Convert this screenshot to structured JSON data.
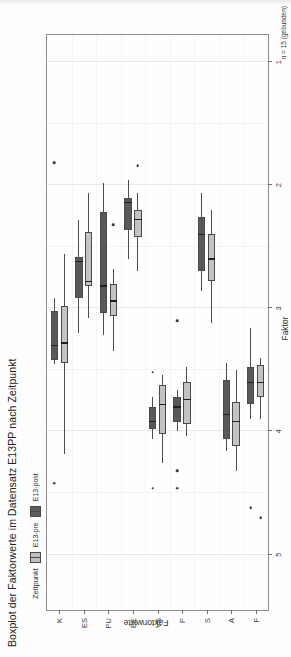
{
  "figure": {
    "title": "Boxplot der Faktorwerte im Datensatz E13PP nach Zeitpunkt",
    "caption": "n = 15 (gebunden)",
    "rotation_degrees": -90
  },
  "legend": {
    "title": "Zeitpunkt",
    "items": [
      {
        "label": "E13-pre",
        "color": "#c3c3c3"
      },
      {
        "label": "E13-post",
        "color": "#595959"
      }
    ]
  },
  "chart_data": {
    "type": "box",
    "title": "Boxplot der Faktorwerte im Datensatz E13PP nach Zeitpunkt",
    "subtitle": "",
    "xlabel": "Faktor",
    "ylabel": "Faktorwerte",
    "caption": "n = 15 (gebunden)",
    "orientation": "horizontal",
    "grid": true,
    "legend_position": "top",
    "value_axis": {
      "label": "Faktorwerte",
      "ticks": [
        5,
        4,
        3,
        2,
        1
      ],
      "ticklabels": [
        "5",
        "4",
        "3",
        "2",
        "1"
      ],
      "lim": [
        5.45,
        0.78
      ],
      "direction": "reversed"
    },
    "category_axis": {
      "label": "Faktor",
      "categories": [
        "K",
        "ES",
        "PU",
        "EE",
        "VS",
        "P",
        "S",
        "A",
        "F"
      ]
    },
    "series": [
      {
        "name": "E13-pre",
        "color": "#c3c3c3"
      },
      {
        "name": "E13-post",
        "color": "#595959"
      }
    ],
    "boxes": [
      {
        "category": "K",
        "group": "E13-post",
        "whisker_low": 3.45,
        "q1": 3.42,
        "median": 3.3,
        "q3": 3.02,
        "whisker_high": 2.92,
        "outliers": [
          4.42,
          1.82
        ]
      },
      {
        "category": "K",
        "group": "E13-pre",
        "whisker_low": 4.18,
        "q1": 3.44,
        "median": 3.28,
        "q3": 2.98,
        "whisker_high": 2.56,
        "outliers": []
      },
      {
        "category": "ES",
        "group": "E13-post",
        "whisker_low": 3.2,
        "q1": 2.92,
        "median": 2.62,
        "q3": 2.58,
        "whisker_high": 2.28,
        "outliers": []
      },
      {
        "category": "ES",
        "group": "E13-pre",
        "whisker_low": 3.08,
        "q1": 2.82,
        "median": 2.78,
        "q3": 2.38,
        "whisker_high": 2.06,
        "outliers": []
      },
      {
        "category": "PU",
        "group": "E13-post",
        "whisker_low": 3.22,
        "q1": 3.04,
        "median": 2.82,
        "q3": 2.22,
        "whisker_high": 1.98,
        "outliers": []
      },
      {
        "category": "PU",
        "group": "E13-pre",
        "whisker_low": 3.35,
        "q1": 3.06,
        "median": 2.94,
        "q3": 2.8,
        "whisker_high": 2.68,
        "outliers": [
          2.32
        ]
      },
      {
        "category": "EE",
        "group": "E13-post",
        "whisker_low": 2.6,
        "q1": 2.36,
        "median": 2.14,
        "q3": 2.1,
        "whisker_high": 1.96,
        "outliers": []
      },
      {
        "category": "EE",
        "group": "E13-pre",
        "whisker_low": 2.7,
        "q1": 2.42,
        "median": 2.28,
        "q3": 2.2,
        "whisker_high": 2.06,
        "outliers": [
          1.84
        ]
      },
      {
        "category": "VS",
        "group": "E13-post",
        "whisker_low": 4.06,
        "q1": 3.98,
        "median": 3.92,
        "q3": 3.8,
        "whisker_high": 3.72,
        "outliers": [
          4.46,
          3.52
        ]
      },
      {
        "category": "VS",
        "group": "E13-pre",
        "whisker_low": 4.26,
        "q1": 4.02,
        "median": 3.78,
        "q3": 3.62,
        "whisker_high": 3.54,
        "outliers": []
      },
      {
        "category": "P",
        "group": "E13-post",
        "whisker_low": 4.0,
        "q1": 3.92,
        "median": 3.8,
        "q3": 3.72,
        "whisker_high": 3.66,
        "outliers": [
          4.46,
          4.32,
          3.1
        ]
      },
      {
        "category": "P",
        "group": "E13-pre",
        "whisker_low": 4.04,
        "q1": 3.94,
        "median": 3.74,
        "q3": 3.6,
        "whisker_high": 3.48,
        "outliers": []
      },
      {
        "category": "S",
        "group": "E13-post",
        "whisker_low": 2.86,
        "q1": 2.7,
        "median": 2.4,
        "q3": 2.26,
        "whisker_high": 2.06,
        "outliers": []
      },
      {
        "category": "S",
        "group": "E13-pre",
        "whisker_low": 3.12,
        "q1": 2.78,
        "median": 2.6,
        "q3": 2.4,
        "whisker_high": 2.2,
        "outliers": []
      },
      {
        "category": "A",
        "group": "E13-post",
        "whisker_low": 4.16,
        "q1": 4.06,
        "median": 3.86,
        "q3": 3.58,
        "whisker_high": 3.44,
        "outliers": []
      },
      {
        "category": "A",
        "group": "E13-pre",
        "whisker_low": 4.32,
        "q1": 4.12,
        "median": 3.92,
        "q3": 3.76,
        "whisker_high": 3.5,
        "outliers": []
      },
      {
        "category": "F",
        "group": "E13-post",
        "whisker_low": 3.9,
        "q1": 3.78,
        "median": 3.6,
        "q3": 3.48,
        "whisker_high": 3.16,
        "outliers": [
          4.62
        ]
      },
      {
        "category": "F",
        "group": "E13-pre",
        "whisker_low": 3.9,
        "q1": 3.72,
        "median": 3.6,
        "q3": 3.46,
        "whisker_high": 3.4,
        "outliers": [
          4.7
        ]
      }
    ]
  }
}
